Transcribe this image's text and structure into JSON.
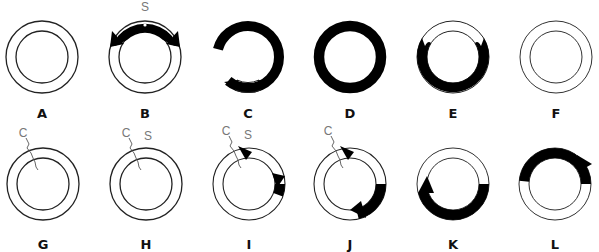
{
  "figure": {
    "ring": {
      "outer_radius": 36,
      "inner_radius": 26,
      "stroke_color": "#222222",
      "fill_color": "#000000"
    },
    "panels": [
      {
        "id": "A",
        "label": "A",
        "cx": 42,
        "cy": 57,
        "filled": [],
        "annotations": []
      },
      {
        "id": "B",
        "label": "B",
        "cx": 145,
        "cy": 57,
        "filled": [
          [
            -60,
            60
          ]
        ],
        "arrows": [
          "left",
          "right"
        ],
        "annotations": [
          "S"
        ],
        "dot": true
      },
      {
        "id": "C",
        "label": "C",
        "cx": 248,
        "cy": 57,
        "filled": [
          [
            -200,
            160
          ]
        ],
        "arrows": [
          "left",
          "right"
        ],
        "annotations": []
      },
      {
        "id": "D",
        "label": "D",
        "cx": 350,
        "cy": 57,
        "filled": [
          [
            0,
            360
          ]
        ],
        "annotations": []
      },
      {
        "id": "E",
        "label": "E",
        "cx": 453,
        "cy": 57,
        "filled": [
          [
            60,
            300
          ]
        ],
        "annotations": []
      },
      {
        "id": "F",
        "label": "F",
        "cx": 556,
        "cy": 57,
        "filled": [],
        "annotations": []
      },
      {
        "id": "G",
        "label": "G",
        "cx": 43,
        "cy": 184,
        "filled": [],
        "annotations": [
          "C"
        ],
        "nick": true
      },
      {
        "id": "H",
        "label": "H",
        "cx": 146,
        "cy": 184,
        "filled": [],
        "annotations": [
          "C",
          "S"
        ],
        "nick": true
      },
      {
        "id": "I",
        "label": "I",
        "cx": 249,
        "cy": 184,
        "filled": [
          [
            -5,
            110
          ]
        ],
        "arrows": [
          "left",
          "right"
        ],
        "annotations": [
          "C",
          "S"
        ],
        "nick": true
      },
      {
        "id": "J",
        "label": "J",
        "cx": 350,
        "cy": 184,
        "filled": [
          [
            -5,
            165
          ]
        ],
        "arrows": [
          "left",
          "right"
        ],
        "annotations": [
          "C"
        ],
        "nick": true
      },
      {
        "id": "K",
        "label": "K",
        "cx": 453,
        "cy": 184,
        "filled": [
          [
            0,
            250
          ]
        ],
        "arrows": [
          "end"
        ],
        "annotations": []
      },
      {
        "id": "L",
        "label": "L",
        "cx": 555,
        "cy": 184,
        "filled": [
          [
            -160,
            60
          ]
        ],
        "arrows": [
          "end"
        ],
        "annotations": []
      }
    ],
    "labels": {
      "A": "A",
      "B": "B",
      "C": "C",
      "D": "D",
      "E": "E",
      "F": "F",
      "G": "G",
      "H": "H",
      "I": "I",
      "J": "J",
      "K": "K",
      "L": "L",
      "s": "S",
      "c": "C"
    }
  }
}
